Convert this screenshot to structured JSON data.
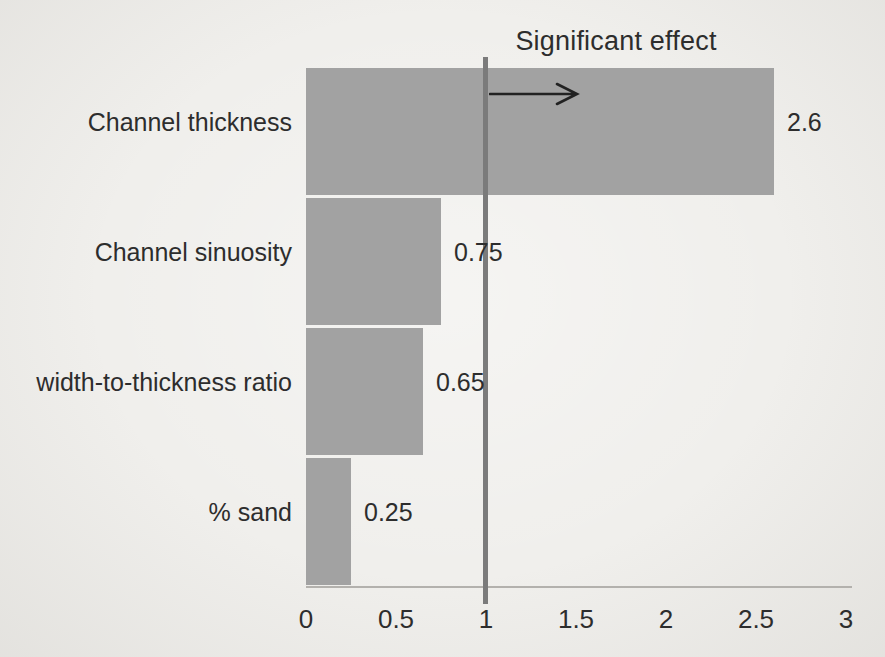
{
  "chart_data": {
    "type": "bar",
    "orientation": "horizontal",
    "title": "Significant effect",
    "categories": [
      "Channel thickness",
      "Channel sinuosity",
      "width-to-thickness ratio",
      "% sand"
    ],
    "values": [
      2.6,
      0.75,
      0.65,
      0.25
    ],
    "value_labels": [
      "2.6",
      "0.75",
      "0.65",
      "0.25"
    ],
    "x_ticks": [
      0,
      0.5,
      1,
      1.5,
      2,
      2.5,
      3
    ],
    "x_tick_labels": [
      "0",
      "0.5",
      "1",
      "1.5",
      "2",
      "2.5",
      "3"
    ],
    "xlim": [
      0,
      3
    ],
    "xlabel": "",
    "ylabel": "",
    "grid": false,
    "legend": false,
    "reference_line_x": 1,
    "annotation_arrow": {
      "at_x": 1,
      "direction": "right",
      "meaning": "values beyond the reference line indicate a significant effect"
    },
    "colors": {
      "bar": "#a2a2a2",
      "reference_line": "#7b7b7b",
      "axis_line": "#b3b1ad",
      "text": "#2d2d2d",
      "arrow": "#222222",
      "background": "#f0efec"
    }
  }
}
